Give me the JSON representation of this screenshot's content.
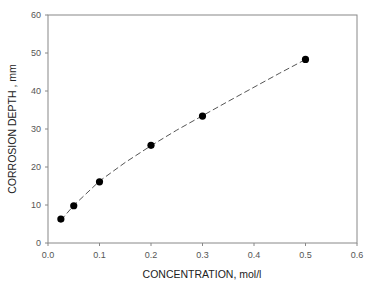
{
  "chart_data": {
    "type": "scatter",
    "title": "",
    "xlabel": "CONCENTRATION, mol/l",
    "ylabel": "CORROSION DEPTH , mm",
    "xlim": [
      0.0,
      0.6
    ],
    "ylim": [
      0,
      60
    ],
    "x_ticks": [
      "0.0",
      "0.1",
      "0.2",
      "0.3",
      "0.4",
      "0.5",
      "0.6"
    ],
    "y_ticks": [
      "0",
      "10",
      "20",
      "30",
      "40",
      "50",
      "60"
    ],
    "grid": false,
    "legend": null,
    "series": [
      {
        "name": "measured",
        "marker": "filled-circle",
        "color": "#000000",
        "x": [
          0.025,
          0.05,
          0.1,
          0.2,
          0.3,
          0.5
        ],
        "y": [
          6.3,
          9.8,
          16.1,
          25.7,
          33.4,
          48.3
        ]
      },
      {
        "name": "fit",
        "style": "dashed-line",
        "color": "#555555",
        "x": [
          0.025,
          0.05,
          0.1,
          0.15,
          0.2,
          0.25,
          0.3,
          0.35,
          0.4,
          0.45,
          0.5
        ],
        "y": [
          6.0,
          9.9,
          16.3,
          21.2,
          25.6,
          29.7,
          33.5,
          37.3,
          41.0,
          44.7,
          48.3
        ]
      }
    ]
  }
}
